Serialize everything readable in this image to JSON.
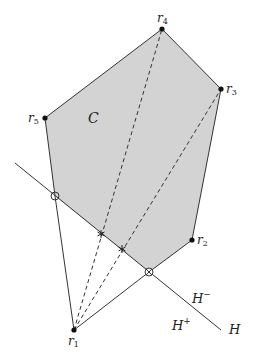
{
  "figure": {
    "width": 254,
    "height": 360,
    "colors": {
      "background": "#ffffff",
      "fill": "#d3d3d3",
      "stroke": "#333333",
      "point": "#111111"
    },
    "region": {
      "label": "C",
      "label_pos": [
        88,
        123
      ]
    },
    "points": [
      {
        "id": "r1",
        "base": "r",
        "sub": "1",
        "xy": [
          74,
          330
        ],
        "label_pos": [
          68,
          345
        ]
      },
      {
        "id": "r2",
        "base": "r",
        "sub": "2",
        "xy": [
          192,
          240
        ],
        "label_pos": [
          197,
          244
        ]
      },
      {
        "id": "r3",
        "base": "r",
        "sub": "3",
        "xy": [
          221,
          89
        ],
        "label_pos": [
          226,
          93
        ]
      },
      {
        "id": "r4",
        "base": "r",
        "sub": "4",
        "xy": [
          162,
          29
        ],
        "label_pos": [
          157,
          22
        ]
      },
      {
        "id": "r5",
        "base": "r",
        "sub": "5",
        "xy": [
          45,
          118
        ],
        "label_pos": [
          28,
          122
        ]
      }
    ],
    "hyperplane": {
      "label": "H",
      "label_pos": [
        229,
        334
      ],
      "from": [
        15,
        163
      ],
      "to": [
        221,
        330
      ],
      "side_minus": {
        "base": "H",
        "sup": "−",
        "pos": [
          192,
          303
        ]
      },
      "side_plus": {
        "base": "H",
        "sup": "+",
        "pos": [
          172,
          330
        ]
      }
    },
    "markers": {
      "open_circle": [
        55,
        196
      ],
      "crossed_circle": [
        149,
        272
      ],
      "stars": [
        [
          101,
          234
        ],
        [
          122,
          249
        ]
      ]
    }
  }
}
